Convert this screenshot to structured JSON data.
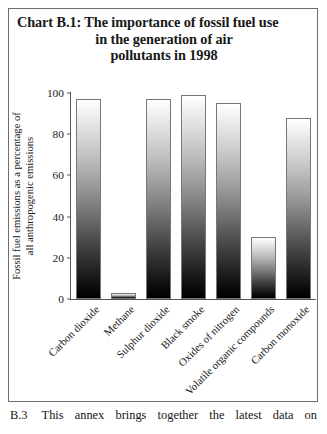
{
  "figure": {
    "title_lines": [
      "Chart B.1: The importance of fossil fuel use",
      "in the generation of air",
      "pollutants in 1998"
    ],
    "frame_color": "#6e6e6e"
  },
  "footer": {
    "label": "B.3",
    "text": "This annex brings together the latest data on"
  },
  "chart_data": {
    "type": "bar",
    "title": "Chart B.1: The importance of fossil fuel use in the generation of air pollutants in 1998",
    "xlabel": "",
    "ylabel": "Fossil fuel emissions as a percentage of all anthropogenic emissions",
    "ylabel_lines": [
      "Fossil fuel emissions as a percentage of",
      "all anthropogenic emissions"
    ],
    "categories": [
      "Carbon dioxide",
      "Methane",
      "Sulphur dioxide",
      "Black smoke",
      "Oxides of nitrogen",
      "Volatile organic compounds",
      "Carbon monoxide"
    ],
    "values": [
      97,
      3,
      97,
      99,
      95,
      30,
      88
    ],
    "ylim": [
      0,
      100
    ],
    "yticks": [
      0,
      20,
      40,
      60,
      80,
      100
    ],
    "ytick_labels": [
      "0",
      "20",
      "40",
      "60",
      "80",
      "100"
    ],
    "grid": false,
    "legend": false,
    "bar_fill": "vertical-gradient-white-to-black",
    "bar_edge_color": "#777777"
  }
}
